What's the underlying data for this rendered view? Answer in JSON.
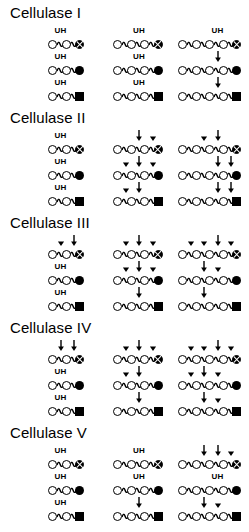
{
  "figure": {
    "symbols": {
      "open_circle": "glucose-open-circle",
      "cross_circle": "crossed-circle-terminal",
      "solid_circle": "filled-circle-terminal",
      "solid_square": "filled-square-terminal",
      "arrow": "down-arrow-cleavage-site",
      "arrowhead": "small-arrowhead-minor-cleavage",
      "uh": "UH"
    },
    "columns_x": [
      48,
      113,
      178
    ],
    "panels": [
      {
        "title": "Cellulase I",
        "rows": [
          {
            "chains": [
              {
                "units": 3,
                "terminal": "cross",
                "ann": [
                  {
                    "pos": 1,
                    "type": "uh"
                  }
                ]
              },
              {
                "units": 4,
                "terminal": "cross",
                "ann": [
                  {
                    "pos": 2,
                    "type": "uh"
                  }
                ]
              },
              {
                "units": 5,
                "terminal": "cross",
                "ann": [
                  {
                    "pos": 3,
                    "type": "uh"
                  }
                ]
              }
            ]
          },
          {
            "chains": [
              {
                "units": 3,
                "terminal": "solid",
                "ann": [
                  {
                    "pos": 1,
                    "type": "uh"
                  }
                ]
              },
              {
                "units": 4,
                "terminal": "solid",
                "ann": [
                  {
                    "pos": 2,
                    "type": "uh"
                  }
                ]
              },
              {
                "units": 5,
                "terminal": "solid",
                "ann": [
                  {
                    "pos": 3,
                    "type": "arrow"
                  }
                ]
              }
            ]
          },
          {
            "chains": [
              {
                "units": 3,
                "terminal": "square",
                "ann": [
                  {
                    "pos": 1,
                    "type": "uh"
                  }
                ]
              },
              {
                "units": 4,
                "terminal": "square",
                "ann": [
                  {
                    "pos": 2,
                    "type": "uh"
                  }
                ]
              },
              {
                "units": 5,
                "terminal": "square",
                "ann": [
                  {
                    "pos": 3,
                    "type": "arrow"
                  }
                ]
              }
            ]
          }
        ]
      },
      {
        "title": "Cellulase II",
        "rows": [
          {
            "chains": [
              {
                "units": 3,
                "terminal": "cross",
                "ann": [
                  {
                    "pos": 1,
                    "type": "uh"
                  }
                ]
              },
              {
                "units": 4,
                "terminal": "cross",
                "ann": [
                  {
                    "pos": 2,
                    "type": "arrow"
                  },
                  {
                    "pos": 3,
                    "type": "head"
                  }
                ]
              },
              {
                "units": 5,
                "terminal": "cross",
                "ann": [
                  {
                    "pos": 2,
                    "type": "head"
                  },
                  {
                    "pos": 3,
                    "type": "arrow"
                  }
                ]
              }
            ]
          },
          {
            "chains": [
              {
                "units": 3,
                "terminal": "solid",
                "ann": [
                  {
                    "pos": 1,
                    "type": "uh"
                  }
                ]
              },
              {
                "units": 4,
                "terminal": "solid",
                "ann": [
                  {
                    "pos": 1,
                    "type": "head"
                  },
                  {
                    "pos": 2,
                    "type": "arrow"
                  },
                  {
                    "pos": 3,
                    "type": "head"
                  }
                ]
              },
              {
                "units": 5,
                "terminal": "solid",
                "ann": [
                  {
                    "pos": 3,
                    "type": "arrow"
                  },
                  {
                    "pos": 4,
                    "type": "arrow"
                  }
                ]
              }
            ]
          },
          {
            "chains": [
              {
                "units": 3,
                "terminal": "square",
                "ann": [
                  {
                    "pos": 1,
                    "type": "uh"
                  }
                ]
              },
              {
                "units": 4,
                "terminal": "square",
                "ann": [
                  {
                    "pos": 1,
                    "type": "head"
                  },
                  {
                    "pos": 2,
                    "type": "arrow"
                  }
                ]
              },
              {
                "units": 5,
                "terminal": "square",
                "ann": [
                  {
                    "pos": 3,
                    "type": "arrow"
                  },
                  {
                    "pos": 4,
                    "type": "arrow"
                  }
                ]
              }
            ]
          }
        ]
      },
      {
        "title": "Cellulase III",
        "rows": [
          {
            "chains": [
              {
                "units": 3,
                "terminal": "cross",
                "ann": [
                  {
                    "pos": 1,
                    "type": "head"
                  },
                  {
                    "pos": 2,
                    "type": "arrow"
                  }
                ]
              },
              {
                "units": 4,
                "terminal": "cross",
                "ann": [
                  {
                    "pos": 1,
                    "type": "head"
                  },
                  {
                    "pos": 2,
                    "type": "arrow"
                  },
                  {
                    "pos": 3,
                    "type": "head"
                  }
                ]
              },
              {
                "units": 5,
                "terminal": "cross",
                "ann": [
                  {
                    "pos": 1,
                    "type": "head"
                  },
                  {
                    "pos": 2,
                    "type": "head"
                  },
                  {
                    "pos": 3,
                    "type": "arrow"
                  },
                  {
                    "pos": 4,
                    "type": "head"
                  }
                ]
              }
            ]
          },
          {
            "chains": [
              {
                "units": 3,
                "terminal": "solid",
                "ann": [
                  {
                    "pos": 1,
                    "type": "uh"
                  }
                ]
              },
              {
                "units": 4,
                "terminal": "solid",
                "ann": [
                  {
                    "pos": 1,
                    "type": "head"
                  },
                  {
                    "pos": 2,
                    "type": "arrow"
                  },
                  {
                    "pos": 3,
                    "type": "head"
                  }
                ]
              },
              {
                "units": 5,
                "terminal": "solid",
                "ann": [
                  {
                    "pos": 2,
                    "type": "arrow"
                  },
                  {
                    "pos": 3,
                    "type": "head"
                  }
                ]
              }
            ]
          },
          {
            "chains": [
              {
                "units": 3,
                "terminal": "square",
                "ann": [
                  {
                    "pos": 1,
                    "type": "uh"
                  }
                ]
              },
              {
                "units": 4,
                "terminal": "square",
                "ann": [
                  {
                    "pos": 2,
                    "type": "arrow"
                  }
                ]
              },
              {
                "units": 5,
                "terminal": "square",
                "ann": [
                  {
                    "pos": 2,
                    "type": "arrow"
                  }
                ]
              }
            ]
          }
        ]
      },
      {
        "title": "Cellulase IV",
        "rows": [
          {
            "chains": [
              {
                "units": 3,
                "terminal": "cross",
                "ann": [
                  {
                    "pos": 1,
                    "type": "arrow"
                  },
                  {
                    "pos": 2,
                    "type": "arrow"
                  }
                ]
              },
              {
                "units": 4,
                "terminal": "cross",
                "ann": [
                  {
                    "pos": 1,
                    "type": "head"
                  },
                  {
                    "pos": 2,
                    "type": "arrow"
                  },
                  {
                    "pos": 3,
                    "type": "head"
                  }
                ]
              },
              {
                "units": 5,
                "terminal": "cross",
                "ann": [
                  {
                    "pos": 1,
                    "type": "head"
                  },
                  {
                    "pos": 2,
                    "type": "head"
                  },
                  {
                    "pos": 3,
                    "type": "arrow"
                  },
                  {
                    "pos": 4,
                    "type": "head"
                  }
                ]
              }
            ]
          },
          {
            "chains": [
              {
                "units": 3,
                "terminal": "solid",
                "ann": [
                  {
                    "pos": 1,
                    "type": "uh"
                  }
                ]
              },
              {
                "units": 4,
                "terminal": "solid",
                "ann": [
                  {
                    "pos": 1,
                    "type": "head"
                  },
                  {
                    "pos": 2,
                    "type": "arrow"
                  }
                ]
              },
              {
                "units": 5,
                "terminal": "solid",
                "ann": [
                  {
                    "pos": 1,
                    "type": "head"
                  },
                  {
                    "pos": 2,
                    "type": "arrow"
                  },
                  {
                    "pos": 3,
                    "type": "head"
                  }
                ]
              }
            ]
          },
          {
            "chains": [
              {
                "units": 3,
                "terminal": "square",
                "ann": [
                  {
                    "pos": 1,
                    "type": "uh"
                  }
                ]
              },
              {
                "units": 4,
                "terminal": "square",
                "ann": [
                  {
                    "pos": 2,
                    "type": "arrow"
                  }
                ]
              },
              {
                "units": 5,
                "terminal": "square",
                "ann": [
                  {
                    "pos": 2,
                    "type": "arrow"
                  },
                  {
                    "pos": 3,
                    "type": "head"
                  }
                ]
              }
            ]
          }
        ]
      },
      {
        "title": "Cellulase V",
        "rows": [
          {
            "chains": [
              {
                "units": 3,
                "terminal": "cross",
                "ann": [
                  {
                    "pos": 1,
                    "type": "uh"
                  }
                ]
              },
              {
                "units": 4,
                "terminal": "cross",
                "ann": [
                  {
                    "pos": 2,
                    "type": "uh"
                  }
                ]
              },
              {
                "units": 5,
                "terminal": "cross",
                "ann": [
                  {
                    "pos": 2,
                    "type": "arrow"
                  },
                  {
                    "pos": 3,
                    "type": "arrow"
                  },
                  {
                    "pos": 4,
                    "type": "head"
                  }
                ]
              }
            ]
          },
          {
            "chains": [
              {
                "units": 3,
                "terminal": "solid",
                "ann": [
                  {
                    "pos": 1,
                    "type": "uh"
                  }
                ]
              },
              {
                "units": 4,
                "terminal": "solid",
                "ann": [
                  {
                    "pos": 2,
                    "type": "uh"
                  }
                ]
              },
              {
                "units": 5,
                "terminal": "solid",
                "ann": [
                  {
                    "pos": 3,
                    "type": "uh"
                  }
                ]
              }
            ]
          },
          {
            "chains": [
              {
                "units": 3,
                "terminal": "square",
                "ann": [
                  {
                    "pos": 1,
                    "type": "uh"
                  }
                ]
              },
              {
                "units": 4,
                "terminal": "square",
                "ann": [
                  {
                    "pos": 2,
                    "type": "arrow"
                  }
                ]
              },
              {
                "units": 5,
                "terminal": "square",
                "ann": [
                  {
                    "pos": 2,
                    "type": "arrow"
                  },
                  {
                    "pos": 3,
                    "type": "head"
                  }
                ]
              }
            ]
          }
        ]
      }
    ]
  }
}
